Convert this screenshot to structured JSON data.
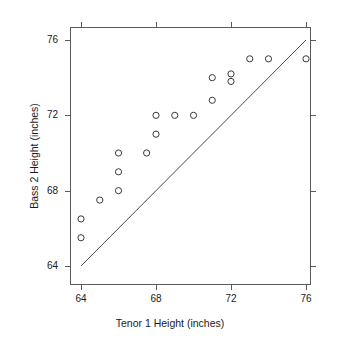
{
  "chart_data": {
    "type": "scatter",
    "title": "",
    "xlabel": "Tenor 1 Height (inches)",
    "ylabel": "Bass 2 Height (inches)",
    "xlim": [
      63.2,
      76.5
    ],
    "ylim": [
      63.2,
      76.3
    ],
    "xticks": [
      64,
      68,
      72,
      76
    ],
    "yticks": [
      64,
      68,
      72,
      76
    ],
    "xticklabels": [
      "64",
      "68",
      "72",
      "76"
    ],
    "yticklabels": [
      "64",
      "68",
      "72",
      "76"
    ],
    "grid": false,
    "legend": null,
    "marker": "open-circle",
    "marker_color": "#3a3a3a",
    "frame_color": "#5a5a5a",
    "points": [
      {
        "x": 64,
        "y": 66.5
      },
      {
        "x": 64,
        "y": 65.5
      },
      {
        "x": 65,
        "y": 67.5
      },
      {
        "x": 66,
        "y": 70
      },
      {
        "x": 66,
        "y": 69
      },
      {
        "x": 66,
        "y": 68
      },
      {
        "x": 67.5,
        "y": 70
      },
      {
        "x": 68,
        "y": 72
      },
      {
        "x": 68,
        "y": 71
      },
      {
        "x": 69,
        "y": 72
      },
      {
        "x": 70,
        "y": 72
      },
      {
        "x": 71,
        "y": 74
      },
      {
        "x": 71,
        "y": 72.8
      },
      {
        "x": 72,
        "y": 74.2
      },
      {
        "x": 72,
        "y": 73.8
      },
      {
        "x": 73,
        "y": 75
      },
      {
        "x": 74,
        "y": 75
      },
      {
        "x": 76,
        "y": 75
      }
    ],
    "reference_line": {
      "name": "identity-line",
      "from": [
        64,
        64
      ],
      "to": [
        76,
        76
      ],
      "color": "#4a4a4a"
    }
  }
}
